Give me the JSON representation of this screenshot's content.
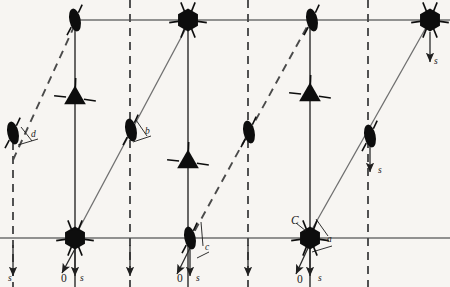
{
  "diagram": {
    "type": "crystallographic-symmetry-diagram",
    "colors": {
      "background": "#f7f5f2",
      "symbol_fill": "#0d0d0d",
      "solid_line": "#6f6f6f",
      "dashed_line": "#4a4a4a",
      "axis_line": "#2a2a2a",
      "label_color": "#1a1a1a"
    },
    "cell": {
      "origin_label": "0",
      "axis_a_label": "a",
      "axis_b_label": "b",
      "axis_c_label": "c",
      "axis_d_label": "d",
      "origin_corner_label": "C",
      "screw_label": "s"
    },
    "labels": [
      {
        "id": "label-d",
        "text": "d",
        "x": 31,
        "y": 137,
        "style": "italic"
      },
      {
        "id": "label-b",
        "text": "b",
        "x": 145,
        "y": 134,
        "style": "italic"
      },
      {
        "id": "label-c",
        "text": "c",
        "x": 205,
        "y": 250,
        "style": "italic"
      },
      {
        "id": "label-a",
        "text": "a",
        "x": 327,
        "y": 242,
        "style": "italic"
      },
      {
        "id": "label-C",
        "text": "C",
        "x": 291,
        "y": 224,
        "style": "italic-cap"
      },
      {
        "id": "label-s-1",
        "text": "s",
        "x": 8,
        "y": 281,
        "style": "italic"
      },
      {
        "id": "label-s-2",
        "text": "s",
        "x": 80,
        "y": 281,
        "style": "italic"
      },
      {
        "id": "label-s-3",
        "text": "s",
        "x": 196,
        "y": 281,
        "style": "italic"
      },
      {
        "id": "label-s-4",
        "text": "s",
        "x": 318,
        "y": 281,
        "style": "italic"
      },
      {
        "id": "label-s-5",
        "text": "s",
        "x": 378,
        "y": 173,
        "style": "italic"
      },
      {
        "id": "label-s-6",
        "text": "s",
        "x": 434,
        "y": 64,
        "style": "italic"
      },
      {
        "id": "label-zero-1",
        "text": "0",
        "x": 61,
        "y": 282,
        "style": "plain"
      },
      {
        "id": "label-zero-2",
        "text": "0",
        "x": 177,
        "y": 282,
        "style": "plain"
      },
      {
        "id": "label-zero-3",
        "text": "0",
        "x": 297,
        "y": 283,
        "style": "plain"
      }
    ],
    "horizontal_lines": [
      {
        "id": "top-edge",
        "y": 20,
        "x1": 70,
        "x2": 450
      },
      {
        "id": "bottom-edge",
        "y": 238,
        "x1": 0,
        "x2": 450
      }
    ],
    "vertical_lines": [
      {
        "id": "v-dash-0",
        "x": 13,
        "style": "dashed",
        "y1": 128,
        "y2": 287
      },
      {
        "id": "v-solid-1",
        "x": 75,
        "style": "solid",
        "y1": 20,
        "y2": 287
      },
      {
        "id": "v-dash-1",
        "x": 130,
        "style": "dashed",
        "y1": 0,
        "y2": 287
      },
      {
        "id": "v-solid-2",
        "x": 188,
        "style": "solid",
        "y1": 20,
        "y2": 287
      },
      {
        "id": "v-dash-2",
        "x": 248,
        "style": "dashed",
        "y1": 0,
        "y2": 287
      },
      {
        "id": "v-solid-3",
        "x": 310,
        "style": "solid",
        "y1": 20,
        "y2": 287
      },
      {
        "id": "v-dash-3",
        "x": 368,
        "style": "dashed",
        "y1": 0,
        "y2": 287
      }
    ],
    "diagonals": [
      {
        "id": "diag-dashed-left",
        "style": "dashed",
        "x1": 13,
        "y1": 160,
        "x2": 78,
        "y2": 18
      },
      {
        "id": "diag-solid-left",
        "style": "solid",
        "x1": 72,
        "y1": 242,
        "x2": 192,
        "y2": 17
      },
      {
        "id": "diag-dashed-mid",
        "style": "dashed",
        "x1": 188,
        "y1": 243,
        "x2": 313,
        "y2": 16
      },
      {
        "id": "diag-solid-right",
        "style": "solid",
        "x1": 306,
        "y1": 240,
        "x2": 432,
        "y2": 17
      }
    ],
    "symbols": [
      {
        "id": "sym-top-ellipse-1",
        "kind": "two-fold-ellipse",
        "x": 75,
        "y": 20
      },
      {
        "id": "sym-top-hex-1",
        "kind": "six-fold-hexagon",
        "x": 188,
        "y": 20
      },
      {
        "id": "sym-top-ellipse-2",
        "kind": "two-fold-ellipse",
        "x": 312,
        "y": 20
      },
      {
        "id": "sym-top-hex-2",
        "kind": "six-fold-hexagon",
        "x": 430,
        "y": 20
      },
      {
        "id": "sym-tri-1",
        "kind": "three-fold-triangle",
        "x": 75,
        "y": 98
      },
      {
        "id": "sym-tri-2",
        "kind": "three-fold-triangle",
        "x": 188,
        "y": 162
      },
      {
        "id": "sym-tri-3",
        "kind": "three-fold-triangle",
        "x": 310,
        "y": 95
      },
      {
        "id": "sym-mid-ellipse-1",
        "kind": "two-fold-ellipse",
        "x": 13,
        "y": 133
      },
      {
        "id": "sym-mid-ellipse-2",
        "kind": "two-fold-ellipse",
        "x": 131,
        "y": 130
      },
      {
        "id": "sym-mid-ellipse-3",
        "kind": "two-fold-ellipse",
        "x": 249,
        "y": 132
      },
      {
        "id": "sym-mid-ellipse-4",
        "kind": "two-fold-ellipse",
        "x": 370,
        "y": 136
      },
      {
        "id": "sym-bot-hex-1",
        "kind": "six-fold-hexagon",
        "x": 75,
        "y": 238
      },
      {
        "id": "sym-bot-ellipse-1",
        "kind": "two-fold-ellipse",
        "x": 190,
        "y": 238
      },
      {
        "id": "sym-bot-hex-2",
        "kind": "six-fold-hexagon",
        "x": 310,
        "y": 238
      }
    ],
    "arrows": [
      {
        "id": "arrow-s-1",
        "kind": "screw-down",
        "x": 13,
        "y1": 245,
        "y2": 276
      },
      {
        "id": "arrow-s-2",
        "kind": "screw-down",
        "x": 75,
        "y1": 246,
        "y2": 276
      },
      {
        "id": "arrow-s-3",
        "kind": "screw-down",
        "x": 130,
        "y1": 245,
        "y2": 276
      },
      {
        "id": "arrow-s-4",
        "kind": "screw-down",
        "x": 190,
        "y1": 247,
        "y2": 276
      },
      {
        "id": "arrow-s-5",
        "kind": "screw-down",
        "x": 248,
        "y1": 245,
        "y2": 276
      },
      {
        "id": "arrow-s-6",
        "kind": "screw-down",
        "x": 310,
        "y1": 247,
        "y2": 276
      },
      {
        "id": "arrow-s-7",
        "kind": "screw-down",
        "x": 370,
        "y1": 143,
        "y2": 172
      },
      {
        "id": "arrow-s-8",
        "kind": "screw-down",
        "x": 430,
        "y1": 32,
        "y2": 62
      },
      {
        "id": "arrow-origin-1",
        "kind": "origin-diagonal",
        "x1": 76,
        "y1": 247,
        "x2": 62,
        "y2": 273
      },
      {
        "id": "arrow-origin-2",
        "kind": "origin-diagonal",
        "x1": 190,
        "y1": 248,
        "x2": 177,
        "y2": 274
      },
      {
        "id": "arrow-origin-3",
        "kind": "origin-diagonal",
        "x1": 308,
        "y1": 248,
        "x2": 296,
        "y2": 274
      }
    ]
  }
}
